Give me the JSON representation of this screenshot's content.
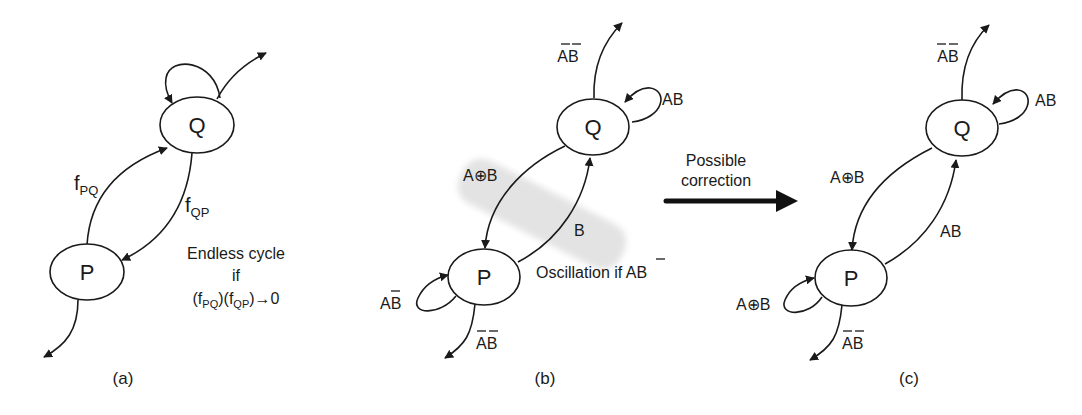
{
  "panels": {
    "a": {
      "caption": "(a)",
      "node_q": "Q",
      "node_p": "P",
      "edge_pq": {
        "base": "f",
        "sub": "PQ"
      },
      "edge_qp": {
        "base": "f",
        "sub": "QP"
      },
      "note": {
        "line1": "Endless cycle",
        "line2": "if",
        "line3": {
          "open1": "(f",
          "sub1": "PQ",
          "mid": ")(f",
          "sub2": "QP",
          "close": ")→0"
        }
      }
    },
    "b": {
      "caption": "(b)",
      "node_q": "Q",
      "node_p": "P",
      "q_exit": {
        "a": "A",
        "b": "B",
        "overbar_a": true,
        "overbar_b": true
      },
      "q_loop": "AB",
      "edge_qp": "A⊕B",
      "edge_pq": "B",
      "p_loop": {
        "a": "A",
        "b": "B",
        "overbar_b": true
      },
      "p_exit": {
        "a": "A",
        "b": "B",
        "overbar_a": true,
        "overbar_b": true
      },
      "note": {
        "prefix": "Oscillation if ",
        "a": "A",
        "b": "B",
        "overbar_a": true
      },
      "highlight_color": "#e6e6e6"
    },
    "transition": {
      "line1": "Possible",
      "line2": "correction"
    },
    "c": {
      "caption": "(c)",
      "node_q": "Q",
      "node_p": "P",
      "q_exit": {
        "a": "A",
        "b": "B"
      },
      "q_loop": "AB",
      "edge_qp": "A⊕B",
      "edge_pq": "AB",
      "p_loop": "A⊕B",
      "p_exit": {
        "a": "A",
        "b": "B"
      }
    }
  }
}
